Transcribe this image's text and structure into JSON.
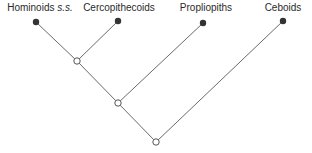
{
  "diagram": {
    "type": "cladogram",
    "colors": {
      "line": "#6a6a6a",
      "leaf": "#333333",
      "node_fill": "#ffffff",
      "node_stroke": "#555555",
      "text": "#2a2a2a"
    },
    "taxa": [
      {
        "id": "hominoids",
        "label": "Hominoids",
        "label_suffix": "s.s.",
        "x": 36,
        "y": 22,
        "label_x": 40,
        "label_y": 2
      },
      {
        "id": "cercopithecoids",
        "label": "Cercopithecoids",
        "label_x": 119,
        "label_y": 2,
        "x": 118,
        "y": 21
      },
      {
        "id": "propliopiths",
        "label": "Propliopiths",
        "label_x": 206,
        "label_y": 2,
        "x": 203,
        "y": 23
      },
      {
        "id": "ceboids",
        "label": "Ceboids",
        "label_x": 283,
        "label_y": 2,
        "x": 283,
        "y": 21
      }
    ],
    "nodes": [
      {
        "id": "node-1",
        "x": 77,
        "y": 61
      },
      {
        "id": "node-2",
        "x": 118,
        "y": 103
      },
      {
        "id": "node-3",
        "x": 156,
        "y": 142
      }
    ],
    "edges": [
      [
        "hominoids",
        "node-1"
      ],
      [
        "cercopithecoids",
        "node-1"
      ],
      [
        "node-1",
        "node-2"
      ],
      [
        "propliopiths",
        "node-2"
      ],
      [
        "node-2",
        "node-3"
      ],
      [
        "ceboids",
        "node-3"
      ]
    ]
  }
}
